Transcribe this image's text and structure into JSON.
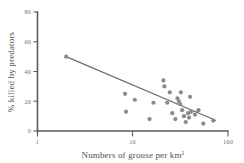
{
  "chart_data": {
    "type": "scatter",
    "title": "",
    "xlabel": "Numbers of grouse per km",
    "xlabel_superscript": "2",
    "ylabel": "% killed by predators",
    "xscale": "log",
    "yscale": "linear",
    "xlim": [
      1,
      100
    ],
    "ylim": [
      0,
      80
    ],
    "xticks": [
      1,
      10,
      100
    ],
    "xtick_labels": [
      "1",
      "10",
      "100"
    ],
    "yticks": [
      0,
      20,
      40,
      60,
      80
    ],
    "ytick_labels": [
      "0",
      "20",
      "40",
      "60",
      "80"
    ],
    "grid": false,
    "legend": "none",
    "point_color": "#8a8a8a",
    "line_color": "#6a6a6a",
    "axis_color": "#5b5b5b",
    "points": [
      {
        "x": 2.0,
        "y": 50
      },
      {
        "x": 8.3,
        "y": 25
      },
      {
        "x": 8.5,
        "y": 13
      },
      {
        "x": 10.5,
        "y": 21
      },
      {
        "x": 15.0,
        "y": 8
      },
      {
        "x": 16.5,
        "y": 19
      },
      {
        "x": 21.0,
        "y": 34
      },
      {
        "x": 21.5,
        "y": 30
      },
      {
        "x": 23.0,
        "y": 19
      },
      {
        "x": 24.5,
        "y": 26
      },
      {
        "x": 26.0,
        "y": 12
      },
      {
        "x": 28.0,
        "y": 8
      },
      {
        "x": 29.5,
        "y": 22
      },
      {
        "x": 30.5,
        "y": 20
      },
      {
        "x": 31.5,
        "y": 18
      },
      {
        "x": 32.0,
        "y": 26
      },
      {
        "x": 33.0,
        "y": 14
      },
      {
        "x": 34.5,
        "y": 10
      },
      {
        "x": 36.0,
        "y": 6
      },
      {
        "x": 38.0,
        "y": 12
      },
      {
        "x": 39.0,
        "y": 9
      },
      {
        "x": 40.0,
        "y": 23
      },
      {
        "x": 41.0,
        "y": 13
      },
      {
        "x": 45.0,
        "y": 11
      },
      {
        "x": 49.0,
        "y": 14
      },
      {
        "x": 55.0,
        "y": 5
      },
      {
        "x": 70.0,
        "y": 7
      }
    ],
    "trend_line": {
      "x_start": 2.0,
      "y_start": 50,
      "x_end": 75.0,
      "y_end": 7
    }
  }
}
